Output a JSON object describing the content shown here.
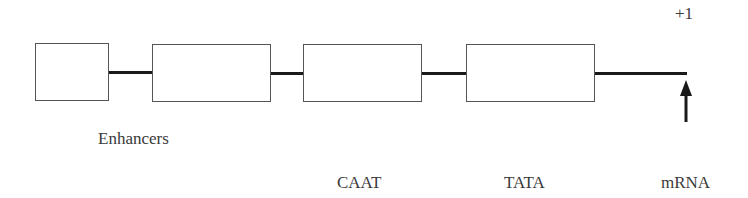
{
  "diagram": {
    "start_marker": "+1",
    "labels": {
      "enhancers": "Enhancers",
      "caat": [
        "CAAT",
        "box"
      ],
      "tata": [
        "TATA",
        "box"
      ],
      "mrna": [
        "mRNA",
        "start",
        "site"
      ]
    },
    "elements": [
      {
        "name": "enhancer-box-1"
      },
      {
        "name": "enhancer-box-2"
      },
      {
        "name": "caat-box"
      },
      {
        "name": "tata-box"
      }
    ],
    "colors": {
      "line": "#1a1a1a",
      "box_border": "#555555",
      "text": "#3a3a3a"
    }
  }
}
